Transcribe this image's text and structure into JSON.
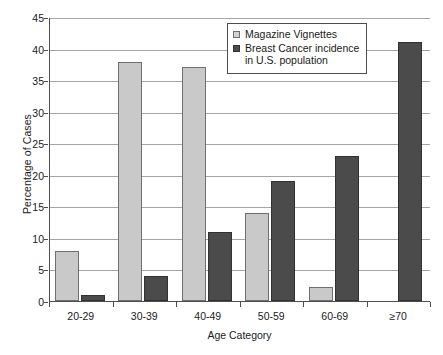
{
  "chart_data": {
    "type": "bar",
    "title": "",
    "xlabel": "Age Category",
    "ylabel": "Percentage of Cases",
    "categories": [
      "20-29",
      "30-39",
      "40-49",
      "50-59",
      "60-69",
      "≥70"
    ],
    "series": [
      {
        "name": "Magazine Vignettes",
        "color": "#c9c9c9",
        "values": [
          8,
          37.8,
          37.1,
          14,
          2.3,
          0
        ]
      },
      {
        "name": "Breast Cancer incidence\nin U.S. population",
        "color": "#4b4b4b",
        "values": [
          1,
          4,
          11,
          19,
          23,
          41
        ]
      }
    ],
    "ylim": [
      0,
      45
    ],
    "yticks": [
      0,
      5,
      10,
      15,
      20,
      25,
      30,
      35,
      40,
      45
    ],
    "ytick_labels": [
      "0",
      "5",
      "10",
      "15",
      "20",
      "25",
      "30",
      "35",
      "40",
      "45"
    ],
    "grid": true,
    "legend_position": "top-center"
  },
  "legend": {
    "items": [
      {
        "label": "Magazine Vignettes",
        "swatch": "light"
      },
      {
        "label": "Breast Cancer incidence\nin U.S. population",
        "swatch": "dark"
      }
    ]
  }
}
